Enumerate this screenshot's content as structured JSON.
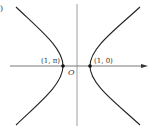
{
  "figure": {
    "panel_label": ")",
    "origin_label": "O",
    "points": [
      {
        "label": "(1, π)",
        "x": 63,
        "y": 66
      },
      {
        "label": "(1, 0)",
        "x": 90,
        "y": 66
      }
    ],
    "colors": {
      "curve": "#222222",
      "axis": "#555555",
      "text": "#333333"
    }
  }
}
